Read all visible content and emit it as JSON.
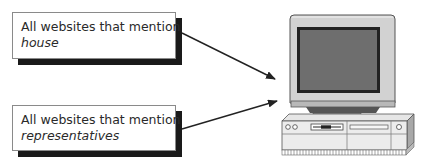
{
  "diagram": {
    "boxes": [
      {
        "text": "All websites that mention",
        "keyword": "house"
      },
      {
        "text": "All websites that mention",
        "keyword": "representatives"
      }
    ],
    "target": "computer-icon",
    "arrows": [
      {
        "from": "box-0",
        "to": "computer"
      },
      {
        "from": "box-1",
        "to": "computer"
      }
    ],
    "colors": {
      "screen": "#6e6e6e",
      "bezel": "#c8c8c8",
      "shadow": "#1a1a1a"
    }
  }
}
